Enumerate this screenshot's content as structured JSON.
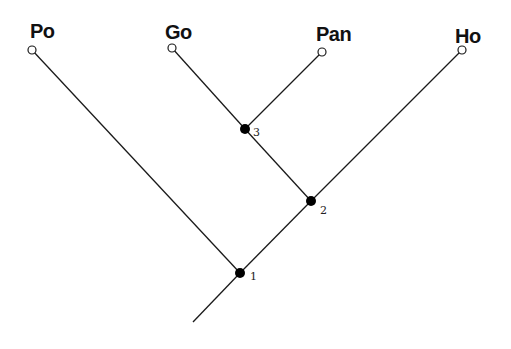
{
  "diagram": {
    "type": "cladogram",
    "taxa": [
      {
        "id": "po",
        "label": "Po",
        "tip": [
          32,
          50
        ],
        "labelPos": [
          30,
          21
        ]
      },
      {
        "id": "go",
        "label": "Go",
        "tip": [
          172,
          48
        ],
        "labelPos": [
          165,
          22
        ]
      },
      {
        "id": "pan",
        "label": "Pan",
        "tip": [
          322,
          52
        ],
        "labelPos": [
          316,
          24
        ]
      },
      {
        "id": "ho",
        "label": "Ho",
        "tip": [
          462,
          50
        ],
        "labelPos": [
          455,
          26
        ]
      }
    ],
    "nodes": [
      {
        "id": "n3",
        "label": "3",
        "pos": [
          245,
          129
        ],
        "labelPos": [
          253,
          127
        ]
      },
      {
        "id": "n2",
        "label": "2",
        "pos": [
          311,
          201
        ],
        "labelPos": [
          320,
          205
        ]
      },
      {
        "id": "n1",
        "label": "1",
        "pos": [
          240,
          273
        ],
        "labelPos": [
          250,
          271
        ]
      }
    ],
    "root": [
      193,
      322
    ],
    "edges": [
      [
        "po",
        "n1"
      ],
      [
        "go",
        "n3"
      ],
      [
        "pan",
        "n3"
      ],
      [
        "n3",
        "n2"
      ],
      [
        "ho",
        "n2"
      ],
      [
        "n2",
        "n1"
      ],
      [
        "n1",
        "root"
      ]
    ],
    "colors": {
      "line": "#1a1a1a",
      "node_fill": "#000000",
      "tip_fill": "#ffffff"
    }
  }
}
